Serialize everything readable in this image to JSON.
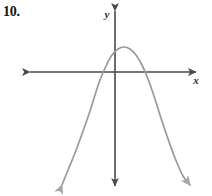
{
  "problem": {
    "number_label": "10."
  },
  "figure": {
    "name": "downward-parabola-graph",
    "background_color": "#ffffff",
    "axis_color": "#4a4a4a",
    "curve_color": "#9a9a9a",
    "axes": {
      "x_axis": {
        "label": "x",
        "label_x": 196,
        "label_y": 84,
        "start_x": 30,
        "end_x": 196,
        "y": 72,
        "arrow_start": true,
        "arrow_end": true
      },
      "y_axis": {
        "label": "y",
        "label_x": 107,
        "label_y": 18,
        "x": 115,
        "start_y": 11,
        "end_y": 186,
        "arrow_start": true,
        "arrow_end": true
      }
    }
  },
  "chart_data": {
    "type": "line",
    "title": "",
    "xlabel": "x",
    "ylabel": "y",
    "grid": false,
    "legend": "none",
    "orientation": "opens-downward",
    "vertex": {
      "x_px": 124,
      "y_px": 47
    },
    "x_intercepts_px": [
      95,
      153
    ],
    "y_intercept_px": {
      "x_px": 115,
      "y_px": 49
    },
    "series": [
      {
        "name": "parabola",
        "color": "#9a9a9a",
        "points_px": [
          [
            62,
            185
          ],
          [
            68,
            170
          ],
          [
            75,
            153
          ],
          [
            82,
            134
          ],
          [
            89,
            114
          ],
          [
            95,
            95
          ],
          [
            100,
            80
          ],
          [
            106,
            66
          ],
          [
            112,
            55
          ],
          [
            118,
            49
          ],
          [
            124,
            47
          ],
          [
            130,
            49
          ],
          [
            136,
            55
          ],
          [
            142,
            65
          ],
          [
            148,
            79
          ],
          [
            154,
            96
          ],
          [
            160,
            115
          ],
          [
            167,
            136
          ],
          [
            175,
            158
          ],
          [
            183,
            176
          ],
          [
            190,
            185
          ]
        ]
      }
    ],
    "axis_ranges_px": {
      "x": [
        30,
        196
      ],
      "y": [
        11,
        186
      ]
    }
  }
}
